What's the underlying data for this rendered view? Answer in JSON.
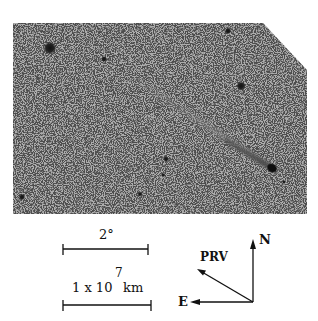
{
  "figure": {
    "photo": {
      "description": "Comet with long ion tail against star field (negative print)",
      "background_color": "#adadad",
      "frame": {
        "left": 13,
        "top": 23,
        "right": 307,
        "bottom": 214,
        "corner_cut": [
          [
            263,
            23
          ],
          [
            307,
            70
          ]
        ]
      },
      "comet": {
        "head": [
          273,
          169
        ],
        "tail_end": [
          118,
          68
        ]
      },
      "stars": [
        {
          "x": 50,
          "y": 48,
          "r": 4.5
        },
        {
          "x": 104,
          "y": 59,
          "r": 2
        },
        {
          "x": 228,
          "y": 31,
          "r": 2.2
        },
        {
          "x": 241,
          "y": 86,
          "r": 3.2
        },
        {
          "x": 166,
          "y": 159,
          "r": 1.8
        },
        {
          "x": 163,
          "y": 175,
          "r": 1.4
        },
        {
          "x": 22,
          "y": 197,
          "r": 2.2
        },
        {
          "x": 140,
          "y": 194,
          "r": 1.6
        },
        {
          "x": 284,
          "y": 182,
          "r": 1.3
        }
      ]
    },
    "scale_bars": [
      {
        "label": "2°",
        "x1": 63,
        "x2": 148,
        "y": 249
      },
      {
        "label_main": "1 x 10",
        "label_exp": "7",
        "label_unit": "km",
        "x1": 63,
        "x2": 151,
        "y": 305
      }
    ],
    "compass": {
      "origin": [
        253,
        302
      ],
      "north_label": "N",
      "east_label": "E",
      "prv_label": "PRV"
    }
  }
}
